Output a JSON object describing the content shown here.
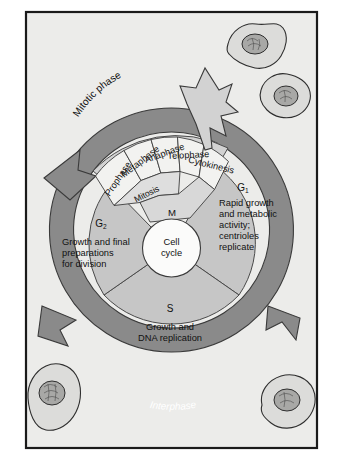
{
  "figure": {
    "center_label_line1": "Cell",
    "center_label_line2": "cycle",
    "outer_ring_label": "Interphase",
    "mitotic_band_label": "Mitotic phase",
    "mitosis_arc_label": "Mitosis",
    "m_label": "M"
  },
  "colors": {
    "page_background": "#ffffff",
    "panel_background": "#ececea",
    "frame_stroke": "#1a1a1a",
    "interphase_ring": "#8a8a8a",
    "interphase_label_text": "#ffffff",
    "sector_fill": "#c6c6c6",
    "mitotic_band_fill": "#d2d2d2",
    "mitosis_segment_fill": "#f2f2f0",
    "center_circle_fill": "#fbfbfa",
    "cell_body_fill": "#dcdcda",
    "cell_nucleus_fill": "#a8a8a6",
    "text": "#111111"
  },
  "phases": [
    {
      "id": "g1",
      "letter": "G",
      "subscript": "1",
      "description_lines": [
        "Rapid growth",
        "and  metabolic",
        "activity;",
        "centrioles",
        "replicate"
      ]
    },
    {
      "id": "s",
      "letter": "S",
      "subscript": "",
      "description_lines": [
        "Growth and",
        "DNA replication"
      ]
    },
    {
      "id": "g2",
      "letter": "G",
      "subscript": "2",
      "description_lines": [
        "Growth and final",
        "preparations",
        "for division"
      ]
    }
  ],
  "mitosis_segments": [
    {
      "id": "prophase",
      "label": "Prophase"
    },
    {
      "id": "metaphase",
      "label": "Metaphase"
    },
    {
      "id": "anaphase",
      "label": "Anaphase"
    },
    {
      "id": "telophase",
      "label": "Telophase"
    },
    {
      "id": "cytokinesis",
      "label": "Cytokinesis"
    }
  ],
  "cells": [
    {
      "id": "cell-top-right-upper",
      "position": "top-right-upper"
    },
    {
      "id": "cell-top-right-lower",
      "position": "top-right-lower"
    },
    {
      "id": "cell-bottom-left",
      "position": "bottom-left"
    },
    {
      "id": "cell-bottom-right",
      "position": "bottom-right"
    }
  ]
}
